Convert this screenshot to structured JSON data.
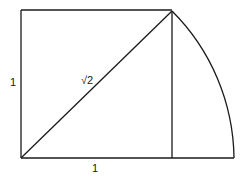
{
  "diagram": {
    "title": "",
    "shapes": {
      "square": {
        "x1": 21,
        "y1": 10,
        "x2": 172,
        "y2": 158
      },
      "diagonal": {
        "x1": 21,
        "y1": 158,
        "x2": 172,
        "y2": 11
      },
      "vertical_line": {
        "x": 172,
        "y1": 11,
        "y2": 158
      },
      "arc": {
        "cx": 21,
        "cy": 158,
        "end_x": 234,
        "end_y": 158
      }
    },
    "labels": {
      "side_left": "1",
      "side_bottom": "1",
      "diagonal": "√2"
    }
  }
}
